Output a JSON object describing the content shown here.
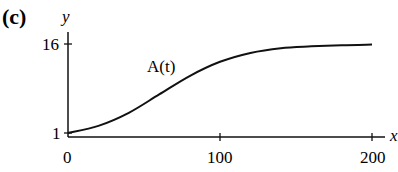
{
  "panel_label": "(c)",
  "chart_data": {
    "type": "line",
    "title": "",
    "panel": "(c)",
    "xlabel": "x",
    "ylabel": "y",
    "x_ticks": [
      0,
      100,
      200
    ],
    "x_tick_labels": [
      "0",
      "100",
      "200"
    ],
    "y_ticks": [
      1,
      16
    ],
    "y_tick_labels": [
      "1",
      "16"
    ],
    "xlim": [
      0,
      205
    ],
    "ylim": [
      0,
      17
    ],
    "grid": false,
    "legend": null,
    "annotations": [
      {
        "text": "A(t)",
        "x": 70,
        "y": 12.5
      }
    ],
    "series": [
      {
        "name": "A(t)",
        "x": [
          0,
          20,
          40,
          60,
          80,
          100,
          120,
          140,
          160,
          180,
          200
        ],
        "values": [
          1.0,
          2.2,
          4.4,
          7.5,
          10.6,
          13.0,
          14.5,
          15.3,
          15.6,
          15.8,
          15.9
        ]
      }
    ]
  },
  "labels": {
    "y_axis": "y",
    "x_axis": "x",
    "tick_16": "16",
    "tick_1": "1",
    "tick_0": "0",
    "tick_100": "100",
    "tick_200": "200",
    "curve": "A(t)"
  }
}
